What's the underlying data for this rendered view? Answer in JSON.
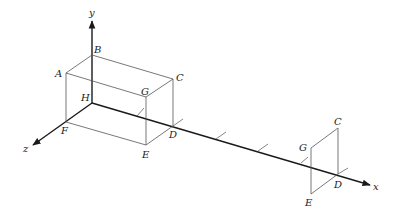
{
  "diagram": {
    "type": "3d-projection",
    "axes": {
      "x": {
        "label": "x"
      },
      "y": {
        "label": "y"
      },
      "z": {
        "label": "z"
      }
    },
    "box_vertices": {
      "A": "A",
      "B": "B",
      "C": "C",
      "G": "G",
      "H": "H",
      "F": "F",
      "E": "E",
      "D": "D"
    },
    "projection_vertices": {
      "G": "G",
      "C": "C",
      "D": "D",
      "E": "E"
    },
    "tick_count": 6,
    "colors": {
      "axis": "#1a1a1a",
      "edge": "#555555",
      "background": "#ffffff"
    }
  }
}
